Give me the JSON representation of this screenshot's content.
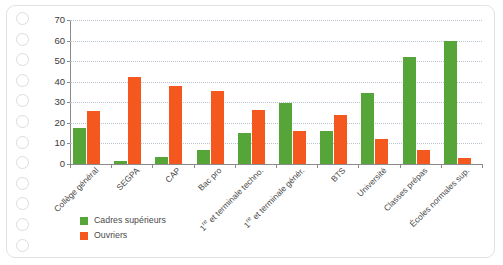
{
  "page": {
    "punch_hole_count": 12,
    "punch_hole_name": "punch-hole"
  },
  "colors": {
    "green": "#55a539",
    "orange": "#f4581f",
    "grid": "#b9c4cf",
    "axis": "#8a8a8a",
    "page_border": "#e2e2e2",
    "hole_ring": "#dcdcdc"
  },
  "chart_data": {
    "type": "bar",
    "title": "",
    "subtitle": "",
    "xlabel": "",
    "ylabel": "",
    "ylim": [
      0,
      70
    ],
    "yticks": [
      0,
      10,
      20,
      30,
      40,
      50,
      60,
      70
    ],
    "grid": true,
    "legend_position": "bottom-left",
    "categories": [
      "Collège général",
      "SEGPA",
      "CAP",
      "Bac pro",
      "1re et terminale techno.",
      "1re et terminale génér.",
      "BTS",
      "Université",
      "Classes prépas",
      "Écoles normales sup."
    ],
    "categories_html": [
      "Collège général",
      "SEGPA",
      "CAP",
      "Bac pro",
      "1<sup>re</sup> et terminale techno.",
      "1<sup>re</sup> et terminale génér.",
      "BTS",
      "Université",
      "Classes prépas",
      "Écoles normales sup."
    ],
    "series": [
      {
        "name": "Cadres supérieurs",
        "color": "#55a539",
        "values": [
          17.5,
          1.5,
          3.5,
          7,
          15,
          29.5,
          16,
          34.5,
          52,
          60
        ]
      },
      {
        "name": "Ouvriers",
        "color": "#f4581f",
        "values": [
          26,
          42.5,
          38,
          35.5,
          26.5,
          16,
          24,
          12,
          7,
          3
        ]
      }
    ]
  },
  "legend": {
    "items": [
      {
        "label": "Cadres supérieurs",
        "color": "#55a539"
      },
      {
        "label": "Ouvriers",
        "color": "#f4581f"
      }
    ]
  }
}
